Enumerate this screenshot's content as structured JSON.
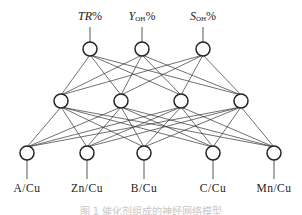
{
  "diagram": {
    "type": "neural-network",
    "layers": {
      "output": {
        "nodes": [
          {
            "id": "o1",
            "x": 90,
            "y": 49,
            "label_main": "TR",
            "label_sub": "",
            "label_suffix": "%"
          },
          {
            "id": "o2",
            "x": 142,
            "y": 49,
            "label_main": "Y",
            "label_sub": "OH",
            "label_suffix": "%"
          },
          {
            "id": "o3",
            "x": 203,
            "y": 49,
            "label_main": "S",
            "label_sub": "OH",
            "label_suffix": "%"
          }
        ]
      },
      "hidden": {
        "nodes": [
          {
            "id": "h1",
            "x": 61,
            "y": 101
          },
          {
            "id": "h2",
            "x": 121,
            "y": 101
          },
          {
            "id": "h3",
            "x": 181,
            "y": 101
          },
          {
            "id": "h4",
            "x": 241,
            "y": 101
          }
        ]
      },
      "input": {
        "nodes": [
          {
            "id": "i1",
            "x": 27,
            "y": 153,
            "label": "A/Cu"
          },
          {
            "id": "i2",
            "x": 87,
            "y": 153,
            "label": "Zn/Cu"
          },
          {
            "id": "i3",
            "x": 144,
            "y": 153,
            "label": "B/Cu"
          },
          {
            "id": "i4",
            "x": 213,
            "y": 153,
            "label": "C/Cu"
          },
          {
            "id": "i5",
            "x": 274,
            "y": 153,
            "label": "Mn/Cu"
          }
        ]
      }
    },
    "connectivity": "fully-connected",
    "caption": "图 1  催化剂组成的神经网络模型"
  }
}
